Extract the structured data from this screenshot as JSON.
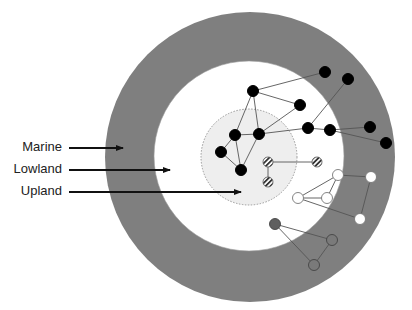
{
  "diagram": {
    "title": "",
    "colors": {
      "marine": "#7f7f7f",
      "lowland": "#ffffff",
      "upland": "#eeeeee",
      "upland_border": "#999999",
      "edge": "#555555",
      "node_black": "#000000",
      "node_white": "#ffffff",
      "node_gray": "#7a7a7a",
      "node_gray_dark": "#5f5f5f"
    },
    "zones": [
      {
        "id": "marine",
        "label": "Marine",
        "cx": 250,
        "cy": 157,
        "r": 145
      },
      {
        "id": "lowland",
        "label": "Lowland",
        "cx": 249,
        "cy": 156,
        "r": 95
      },
      {
        "id": "upland",
        "label": "Upland",
        "cx": 249,
        "cy": 157,
        "r": 48
      }
    ],
    "labels": [
      {
        "text": "Marine",
        "x": 0,
        "y": 139,
        "arrow": {
          "x1": 69,
          "y1": 148,
          "x2": 125,
          "y2": 148
        }
      },
      {
        "text": "Lowland",
        "x": 0,
        "y": 161,
        "arrow": {
          "x1": 69,
          "y1": 170,
          "x2": 172,
          "y2": 170
        }
      },
      {
        "text": "Upland",
        "x": 0,
        "y": 183,
        "arrow": {
          "x1": 69,
          "y1": 192,
          "x2": 243,
          "y2": 192
        }
      }
    ],
    "node_groups": [
      {
        "id": "black-network",
        "style": "black",
        "nodes": [
          {
            "id": "A",
            "x": 253,
            "y": 91
          },
          {
            "id": "B",
            "x": 325,
            "y": 72
          },
          {
            "id": "C",
            "x": 300,
            "y": 105
          },
          {
            "id": "D",
            "x": 235,
            "y": 135
          },
          {
            "id": "E",
            "x": 259,
            "y": 134
          },
          {
            "id": "F",
            "x": 308,
            "y": 128
          },
          {
            "id": "G",
            "x": 330,
            "y": 130
          },
          {
            "id": "H",
            "x": 348,
            "y": 79
          },
          {
            "id": "I",
            "x": 370,
            "y": 127
          },
          {
            "id": "J",
            "x": 386,
            "y": 143
          },
          {
            "id": "K",
            "x": 221,
            "y": 152
          },
          {
            "id": "L",
            "x": 241,
            "y": 170
          }
        ],
        "edges": [
          [
            "A",
            "B"
          ],
          [
            "A",
            "C"
          ],
          [
            "A",
            "D"
          ],
          [
            "A",
            "E"
          ],
          [
            "C",
            "E"
          ],
          [
            "E",
            "F"
          ],
          [
            "F",
            "H"
          ],
          [
            "F",
            "G"
          ],
          [
            "G",
            "I"
          ],
          [
            "G",
            "J"
          ],
          [
            "D",
            "E"
          ],
          [
            "D",
            "K"
          ],
          [
            "K",
            "L"
          ],
          [
            "D",
            "L"
          ],
          [
            "E",
            "L"
          ]
        ]
      },
      {
        "id": "striped-network",
        "style": "striped",
        "nodes": [
          {
            "id": "S1",
            "x": 268,
            "y": 162
          },
          {
            "id": "S2",
            "x": 268,
            "y": 182
          },
          {
            "id": "S3",
            "x": 317,
            "y": 162
          }
        ],
        "edges": [
          [
            "S1",
            "S2"
          ],
          [
            "S1",
            "S3"
          ]
        ]
      },
      {
        "id": "white-network",
        "style": "white",
        "nodes": [
          {
            "id": "W1",
            "x": 338,
            "y": 175
          },
          {
            "id": "W2",
            "x": 371,
            "y": 177
          },
          {
            "id": "W3",
            "x": 298,
            "y": 198
          },
          {
            "id": "W4",
            "x": 327,
            "y": 198
          },
          {
            "id": "W5",
            "x": 360,
            "y": 219
          }
        ],
        "edges": [
          [
            "W1",
            "W2"
          ],
          [
            "W1",
            "W3"
          ],
          [
            "W1",
            "W4"
          ],
          [
            "W3",
            "W4"
          ],
          [
            "W3",
            "W5"
          ],
          [
            "W2",
            "W5"
          ]
        ]
      },
      {
        "id": "gray-network",
        "style": "gray",
        "nodes": [
          {
            "id": "G1",
            "x": 275,
            "y": 224
          },
          {
            "id": "G2",
            "x": 332,
            "y": 240
          },
          {
            "id": "G3",
            "x": 314,
            "y": 265
          }
        ],
        "edges": [
          [
            "G1",
            "G2"
          ],
          [
            "G1",
            "G3"
          ],
          [
            "G2",
            "G3"
          ]
        ]
      }
    ]
  }
}
